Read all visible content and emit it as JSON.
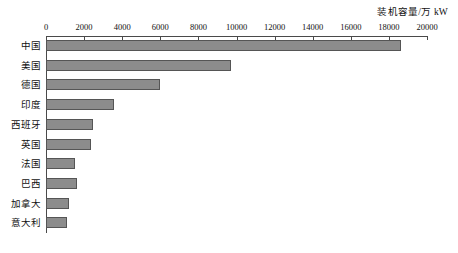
{
  "chart_data": {
    "type": "bar",
    "orientation": "horizontal",
    "title": "装机容量/万 kW",
    "xlabel": "",
    "ylabel": "",
    "categories": [
      "中国",
      "美国",
      "德国",
      "印度",
      "西班牙",
      "英国",
      "法国",
      "巴西",
      "加拿大",
      "意大利"
    ],
    "values": [
      18640,
      9710,
      5990,
      3570,
      2470,
      2360,
      1520,
      1630,
      1210,
      1100
    ],
    "xlim": [
      0,
      20000
    ],
    "xticks": [
      0,
      2000,
      4000,
      6000,
      8000,
      10000,
      12000,
      14000,
      16000,
      18000,
      20000
    ],
    "xtick_labels": [
      "0",
      "2000",
      "4000",
      "6000",
      "8000",
      "10000",
      "12000",
      "14000",
      "16000",
      "18000",
      "20000"
    ],
    "grid": false,
    "legend": null,
    "bar_color": "#8c8c8c",
    "bar_border_color": "#555555",
    "axis_color": "#4a4a4a"
  }
}
